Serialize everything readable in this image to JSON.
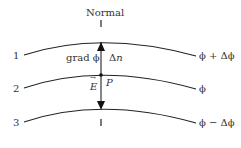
{
  "title": "Normal",
  "surfaces": [
    {
      "index_label": "1",
      "potential_label": "ϕ + Δϕ"
    },
    {
      "index_label": "2",
      "potential_label": "ϕ"
    },
    {
      "index_label": "3",
      "potential_label": "ϕ − Δϕ"
    }
  ],
  "labels": {
    "gradient": "grad ϕ",
    "delta_n": "Δn",
    "point": "P",
    "field": "E"
  },
  "colors": {
    "line": "#222222",
    "text": "#333333"
  }
}
